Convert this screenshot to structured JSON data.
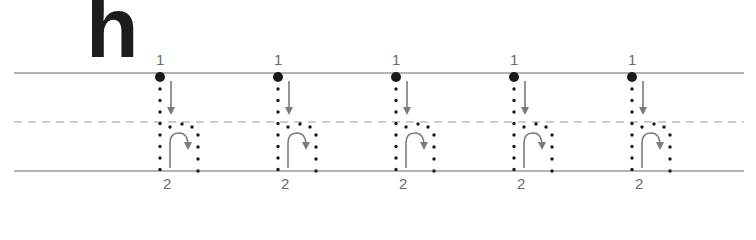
{
  "worksheet": {
    "letter": "h",
    "colors": {
      "letter": "#1c1c1c",
      "guide_lines": "#9a9a9a",
      "dots": "#1a1a1a",
      "arrows": "#7a7a7a",
      "numbers": "#6b6b6b"
    },
    "guide_lines": [
      {
        "name": "top-line",
        "style": "solid"
      },
      {
        "name": "mid-line",
        "style": "dashed"
      },
      {
        "name": "base-line",
        "style": "solid"
      }
    ],
    "traces": [
      {
        "stroke1_label": "1",
        "stroke2_label": "2"
      },
      {
        "stroke1_label": "1",
        "stroke2_label": "2"
      },
      {
        "stroke1_label": "1",
        "stroke2_label": "2"
      },
      {
        "stroke1_label": "1",
        "stroke2_label": "2"
      },
      {
        "stroke1_label": "1",
        "stroke2_label": "2"
      }
    ]
  }
}
